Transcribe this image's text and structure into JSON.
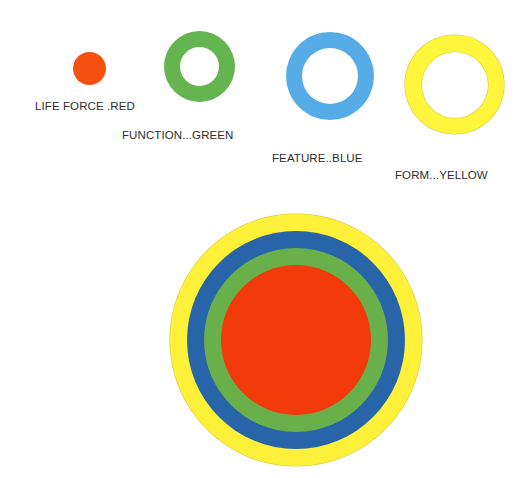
{
  "legend": [
    {
      "label": "LIFE FORCE .RED",
      "color": "#F4500F",
      "shape": "solid-dot"
    },
    {
      "label": "FUNCTION...GREEN",
      "color": "#64B450",
      "shape": "ring"
    },
    {
      "label": "FEATURE..BLUE",
      "color": "#55ACE6",
      "shape": "ring"
    },
    {
      "label": "FORM...YELLOW",
      "color": "#FFF53A",
      "shape": "ring"
    }
  ],
  "concentric": {
    "layers_outer_to_inner": [
      {
        "name": "form",
        "color": "#FFF03A"
      },
      {
        "name": "feature",
        "color": "#2865A8"
      },
      {
        "name": "function",
        "color": "#6AB04A"
      },
      {
        "name": "life-force",
        "color": "#F23A0A"
      }
    ]
  }
}
